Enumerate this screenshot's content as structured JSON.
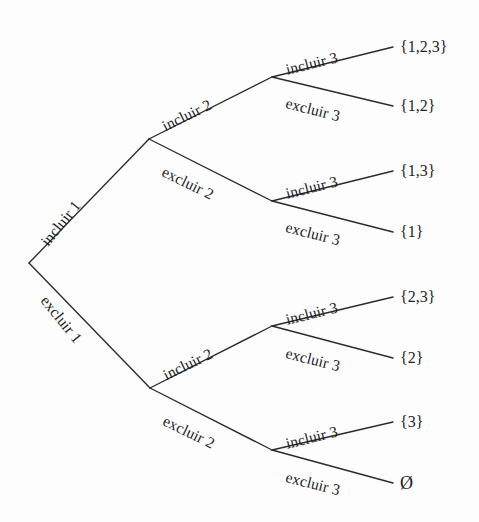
{
  "figure": {
    "background_color": "#fdfdfd",
    "line_color": "#2b2b2b",
    "text_color": "#1e1e1e"
  },
  "edges": {
    "level1": [
      {
        "id": "incluir-1",
        "label": "incluir 1",
        "x": 44,
        "y": 236,
        "angle": -51
      },
      {
        "id": "excluir-1",
        "label": "excluir 1",
        "x": 44,
        "y": 290,
        "angle": 51
      }
    ],
    "level2": [
      {
        "id": "incluir-2-top",
        "label": "incluir 2",
        "x": 163,
        "y": 119,
        "angle": -26
      },
      {
        "id": "excluir-2-top",
        "label": "excluir 2",
        "x": 163,
        "y": 163,
        "angle": 26
      },
      {
        "id": "incluir-2-bottom",
        "label": "incluir 2",
        "x": 164,
        "y": 368,
        "angle": -26
      },
      {
        "id": "excluir-2-bottom",
        "label": "excluir 2",
        "x": 164,
        "y": 412,
        "angle": 26
      }
    ],
    "level3": [
      {
        "id": "incluir-3-a",
        "label": "incluir 3",
        "x": 286,
        "y": 62,
        "angle": -14
      },
      {
        "id": "excluir-3-a",
        "label": "excluir 3",
        "x": 286,
        "y": 95,
        "angle": 14
      },
      {
        "id": "incluir-3-b",
        "label": "incluir 3",
        "x": 286,
        "y": 186,
        "angle": -14
      },
      {
        "id": "excluir-3-b",
        "label": "excluir 3",
        "x": 286,
        "y": 219,
        "angle": 14
      },
      {
        "id": "incluir-3-c",
        "label": "incluir 3",
        "x": 286,
        "y": 312,
        "angle": -14
      },
      {
        "id": "excluir-3-c",
        "label": "excluir 3",
        "x": 286,
        "y": 345,
        "angle": 14
      },
      {
        "id": "incluir-3-d",
        "label": "incluir 3",
        "x": 286,
        "y": 436,
        "angle": -14
      },
      {
        "id": "excluir-3-d",
        "label": "excluir 3",
        "x": 286,
        "y": 469,
        "angle": 14
      }
    ]
  },
  "leaves": [
    {
      "id": "leaf-123",
      "label": "{1,2,3}",
      "x": 400,
      "y": 47
    },
    {
      "id": "leaf-12",
      "label": "{1,2}",
      "x": 400,
      "y": 106
    },
    {
      "id": "leaf-13",
      "label": "{1,3}",
      "x": 400,
      "y": 171
    },
    {
      "id": "leaf-1",
      "label": "{1}",
      "x": 400,
      "y": 232
    },
    {
      "id": "leaf-23",
      "label": "{2,3}",
      "x": 400,
      "y": 297
    },
    {
      "id": "leaf-2",
      "label": "{2}",
      "x": 400,
      "y": 358
    },
    {
      "id": "leaf-3",
      "label": "{3}",
      "x": 400,
      "y": 422
    },
    {
      "id": "leaf-empty",
      "label": "Ø",
      "x": 400,
      "y": 483
    }
  ],
  "nodes": {
    "root": {
      "x": 29,
      "y": 263
    },
    "level1_top": {
      "x": 149,
      "y": 139
    },
    "level1_bot": {
      "x": 150,
      "y": 388
    },
    "level2_a": {
      "x": 272,
      "y": 77
    },
    "level2_b": {
      "x": 272,
      "y": 201
    },
    "level2_c": {
      "x": 272,
      "y": 326
    },
    "level2_d": {
      "x": 272,
      "y": 450
    }
  },
  "segments": [
    {
      "id": "seg-root-incluir1",
      "from": [
        29,
        263
      ],
      "to": [
        149,
        139
      ]
    },
    {
      "id": "seg-root-excluir1",
      "from": [
        29,
        263
      ],
      "to": [
        150,
        388
      ]
    },
    {
      "id": "seg-n1t-incluir2",
      "from": [
        149,
        139
      ],
      "to": [
        272,
        77
      ]
    },
    {
      "id": "seg-n1t-excluir2",
      "from": [
        149,
        139
      ],
      "to": [
        272,
        201
      ]
    },
    {
      "id": "seg-n1b-incluir2",
      "from": [
        150,
        388
      ],
      "to": [
        272,
        326
      ]
    },
    {
      "id": "seg-n1b-excluir2",
      "from": [
        150,
        388
      ],
      "to": [
        272,
        450
      ]
    },
    {
      "id": "seg-n2a-incluir3",
      "from": [
        272,
        77
      ],
      "to": [
        393,
        47
      ]
    },
    {
      "id": "seg-n2a-excluir3",
      "from": [
        272,
        77
      ],
      "to": [
        393,
        106
      ]
    },
    {
      "id": "seg-n2b-incluir3",
      "from": [
        272,
        201
      ],
      "to": [
        393,
        171
      ]
    },
    {
      "id": "seg-n2b-excluir3",
      "from": [
        272,
        201
      ],
      "to": [
        393,
        232
      ]
    },
    {
      "id": "seg-n2c-incluir3",
      "from": [
        272,
        326
      ],
      "to": [
        393,
        297
      ]
    },
    {
      "id": "seg-n2c-excluir3",
      "from": [
        272,
        326
      ],
      "to": [
        393,
        358
      ]
    },
    {
      "id": "seg-n2d-incluir3",
      "from": [
        272,
        450
      ],
      "to": [
        393,
        422
      ]
    },
    {
      "id": "seg-n2d-excluir3",
      "from": [
        272,
        450
      ],
      "to": [
        393,
        483
      ]
    }
  ]
}
